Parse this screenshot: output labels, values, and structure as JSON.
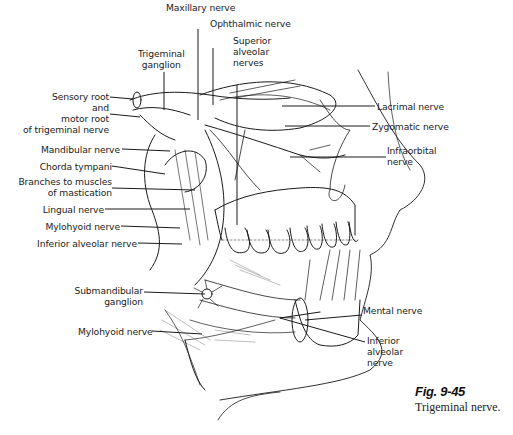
{
  "figure": {
    "number": "Fig. 9-45",
    "caption": "Trigeminal nerve."
  },
  "labels": {
    "maxillary_nerve": "Maxillary nerve",
    "ophthalmic_nerve": "Ophthalmic nerve",
    "trigeminal_ganglion_1": "Trigeminal",
    "trigeminal_ganglion_2": "ganglion",
    "superior_alveolar_1": "Superior",
    "superior_alveolar_2": "alveolar",
    "superior_alveolar_3": "nerves",
    "sensory_root_1": "Sensory root",
    "sensory_root_2": "and",
    "sensory_root_3": "motor root",
    "sensory_root_4": "of trigeminal nerve",
    "lacrimal_nerve": "Lacrimal nerve",
    "zygomatic_nerve": "Zygomatic nerve",
    "infraorbital_1": "Infraorbital",
    "infraorbital_2": "nerve",
    "mandibular_nerve": "Mandibular nerve",
    "chorda_tympani": "Chorda tympani",
    "branches_mastication_1": "Branches to muscles",
    "branches_mastication_2": "of mastication",
    "lingual_nerve": "Lingual nerve",
    "mylohyoid_nerve_upper": "Mylohyoid nerve",
    "inferior_alveolar_left": "Inferior alveolar nerve",
    "submandibular_1": "Submandibular",
    "submandibular_2": "ganglion",
    "mylohyoid_nerve_lower": "Mylohyoid nerve",
    "mental_nerve": "Mental nerve",
    "inferior_alveolar_right_1": "Inferior",
    "inferior_alveolar_right_2": "alveolar",
    "inferior_alveolar_right_3": "nerve"
  },
  "colors": {
    "ink": "#1a1a1a",
    "background": "#ffffff"
  }
}
